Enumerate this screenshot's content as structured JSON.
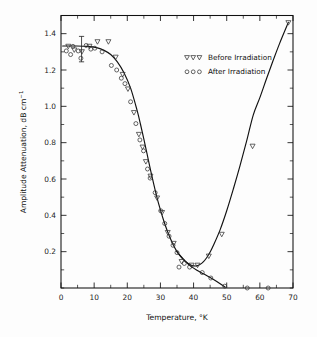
{
  "chart_data": {
    "type": "scatter",
    "title": "",
    "xlabel": "Temperature, °K",
    "ylabel": "Amplitude Attenuation, dB cm⁻¹",
    "ylabel_main": "Amplitude Attenuation, dB cm",
    "ylabel_sup": "−1",
    "xlim": [
      0,
      70
    ],
    "ylim": [
      0,
      1.5
    ],
    "grid": false,
    "legend_position": "top-right",
    "xticks": [
      0,
      10,
      20,
      30,
      40,
      50,
      60,
      70
    ],
    "xtick_labels": [
      "0",
      "10",
      "20",
      "30",
      "40",
      "50",
      "60",
      "70"
    ],
    "xminor_step": 5,
    "yticks": [
      0.2,
      0.4,
      0.6,
      0.8,
      1.0,
      1.2,
      1.4
    ],
    "ytick_labels": [
      "0.2",
      "0.4",
      "0.6",
      "0.8",
      "1.0",
      "1.2",
      "1.4"
    ],
    "yminor_step": 0.1,
    "series": [
      {
        "name": "Before Irradiation",
        "marker": "triangle-down",
        "points": [
          [
            2.2,
            1.33
          ],
          [
            4.0,
            1.31
          ],
          [
            6.3,
            1.3
          ],
          [
            8.6,
            1.33
          ],
          [
            11.0,
            1.355
          ],
          [
            14.3,
            1.355
          ],
          [
            16.5,
            1.27
          ],
          [
            18.6,
            1.175
          ],
          [
            20.2,
            1.095
          ],
          [
            22.0,
            0.965
          ],
          [
            23.5,
            0.845
          ],
          [
            24.6,
            0.775
          ],
          [
            25.6,
            0.695
          ],
          [
            27.0,
            0.615
          ],
          [
            29.0,
            0.495
          ],
          [
            30.5,
            0.415
          ],
          [
            32.2,
            0.305
          ],
          [
            34.0,
            0.245
          ],
          [
            36.4,
            0.145
          ],
          [
            39.4,
            0.125
          ],
          [
            41.2,
            0.125
          ],
          [
            44.6,
            0.175
          ],
          [
            48.5,
            0.295
          ],
          [
            57.8,
            0.78
          ],
          [
            68.6,
            1.46
          ]
        ]
      },
      {
        "name": "After Irradiation",
        "marker": "circle",
        "points": [
          [
            1.6,
            1.305
          ],
          [
            2.9,
            1.285
          ],
          [
            3.6,
            1.33
          ],
          [
            5.2,
            1.305
          ],
          [
            6.0,
            1.265
          ],
          [
            7.6,
            1.335
          ],
          [
            9.0,
            1.315
          ],
          [
            10.2,
            1.32
          ],
          [
            12.4,
            1.3
          ],
          [
            15.2,
            1.225
          ],
          [
            16.8,
            1.2
          ],
          [
            18.2,
            1.155
          ],
          [
            19.3,
            1.125
          ],
          [
            21.0,
            1.025
          ],
          [
            22.6,
            0.905
          ],
          [
            23.8,
            0.815
          ],
          [
            24.9,
            0.755
          ],
          [
            26.1,
            0.655
          ],
          [
            26.9,
            0.605
          ],
          [
            28.4,
            0.525
          ],
          [
            30.1,
            0.425
          ],
          [
            31.3,
            0.355
          ],
          [
            32.6,
            0.285
          ],
          [
            33.8,
            0.235
          ],
          [
            35.0,
            0.195
          ],
          [
            35.6,
            0.115
          ],
          [
            37.2,
            0.135
          ],
          [
            38.8,
            0.115
          ],
          [
            42.6,
            0.085
          ],
          [
            45.2,
            0.055
          ],
          [
            49.4,
            0.01
          ],
          [
            56.2,
            0.0
          ],
          [
            62.5,
            0.0
          ]
        ]
      }
    ],
    "error_bar": {
      "x": 6.2,
      "y": 1.315,
      "ymin": 1.245,
      "ymax": 1.385
    },
    "fit_curve_main": [
      [
        0.5,
        1.332
      ],
      [
        4,
        1.332
      ],
      [
        8,
        1.33
      ],
      [
        11,
        1.322
      ],
      [
        13,
        1.308
      ],
      [
        15,
        1.285
      ],
      [
        17,
        1.245
      ],
      [
        19,
        1.185
      ],
      [
        21,
        1.1
      ],
      [
        23,
        0.975
      ],
      [
        24,
        0.9
      ],
      [
        25,
        0.82
      ],
      [
        26,
        0.735
      ],
      [
        27,
        0.65
      ],
      [
        28,
        0.57
      ],
      [
        29,
        0.495
      ],
      [
        30,
        0.43
      ],
      [
        31,
        0.37
      ],
      [
        32,
        0.318
      ],
      [
        33,
        0.272
      ],
      [
        34,
        0.232
      ],
      [
        35,
        0.2
      ],
      [
        36,
        0.175
      ],
      [
        37,
        0.155
      ],
      [
        38,
        0.14
      ],
      [
        39,
        0.128
      ],
      [
        40,
        0.122
      ],
      [
        41,
        0.122
      ],
      [
        42,
        0.13
      ],
      [
        43,
        0.145
      ],
      [
        44,
        0.168
      ],
      [
        45,
        0.198
      ],
      [
        46,
        0.235
      ],
      [
        48,
        0.32
      ],
      [
        50,
        0.425
      ],
      [
        52,
        0.545
      ],
      [
        54,
        0.672
      ],
      [
        56,
        0.808
      ],
      [
        58,
        0.952
      ],
      [
        60,
        1.048
      ],
      [
        62,
        1.152
      ],
      [
        64,
        1.252
      ],
      [
        66,
        1.348
      ],
      [
        68.6,
        1.462
      ]
    ],
    "fit_curve_lower": [
      [
        34.8,
        0.205
      ],
      [
        36,
        0.178
      ],
      [
        37.5,
        0.148
      ],
      [
        39,
        0.122
      ],
      [
        41,
        0.098
      ],
      [
        43,
        0.078
      ],
      [
        45,
        0.058
      ],
      [
        47,
        0.036
      ],
      [
        49.5,
        0.005
      ]
    ]
  },
  "legend": {
    "entries": [
      {
        "label": "Before Irradiation",
        "marker": "triangle-down"
      },
      {
        "label": "After Irradiation",
        "marker": "circle"
      }
    ]
  }
}
